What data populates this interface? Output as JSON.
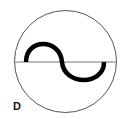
{
  "diagram": {
    "label": "D",
    "symbol": "ac-source-sine-wave-in-circle",
    "colors": {
      "circle": "#555555",
      "axis": "#777777",
      "wave": "#000000",
      "background": "#ffffff"
    }
  }
}
